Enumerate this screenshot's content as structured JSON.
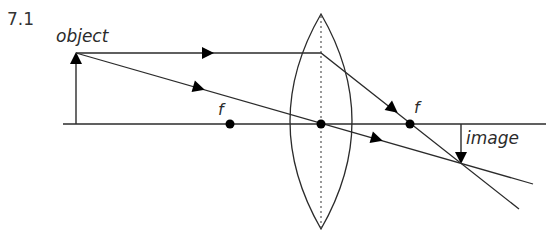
{
  "header": {
    "question_number": "7.1"
  },
  "diagram": {
    "type": "ray-diagram-converging-lens",
    "labels": {
      "object": "object",
      "image": "image",
      "focal_left": "f",
      "focal_right": "f"
    },
    "colors": {
      "line": "#2b2b2b",
      "dots": "#000000",
      "background": "#ffffff"
    },
    "geometry": {
      "principal_axis": {
        "x1": 63,
        "x2": 546,
        "y": 124
      },
      "lens": {
        "center_x": 321,
        "top_y": 14,
        "bottom_y": 229,
        "half_width": 38
      },
      "object_arrow": {
        "x": 76,
        "base_y": 124,
        "tip_y": 53
      },
      "image_arrow": {
        "x": 461,
        "base_y": 124,
        "tip_y": 163
      },
      "focal_points": [
        {
          "name": "f-left",
          "x": 230,
          "y": 124
        },
        {
          "name": "optical-center",
          "x": 321,
          "y": 124
        },
        {
          "name": "f-right",
          "x": 410,
          "y": 124
        }
      ],
      "rays": [
        {
          "name": "parallel-ray",
          "points": [
            [
              76,
              53
            ],
            [
              321,
              53
            ],
            [
              519,
              209
            ]
          ]
        },
        {
          "name": "central-ray",
          "points": [
            [
              76,
              53
            ],
            [
              533,
              184
            ]
          ]
        }
      ]
    }
  }
}
